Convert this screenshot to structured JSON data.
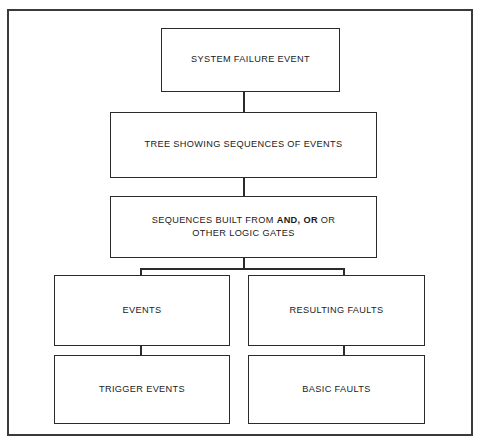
{
  "diagram": {
    "frame_color": "#3a3a3a",
    "box_border_color": "#2b2b2b",
    "text_color": "#1a1a1a",
    "background": "#ffffff",
    "nodes": {
      "system_failure_event": "SYSTEM FAILURE EVENT",
      "tree_showing_sequences": "TREE SHOWING SEQUENCES OF EVENTS",
      "sequences_built_line1_pre": "SEQUENCES BUILT FROM ",
      "sequences_built_bold1": "AND,",
      "sequences_built_mid": " ",
      "sequences_built_bold2": "OR",
      "sequences_built_line1_post": " OR",
      "sequences_built_line2": "OTHER LOGIC GATES",
      "events": "EVENTS",
      "resulting_faults": "RESULTING FAULTS",
      "trigger_events": "TRIGGER EVENTS",
      "basic_faults": "BASIC FAULTS"
    }
  }
}
